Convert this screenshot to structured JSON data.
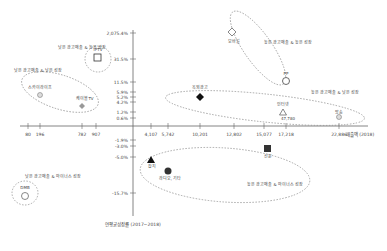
{
  "chart_data": {
    "type": "scatter",
    "title": "",
    "xlabel": "매출액 (2018)",
    "ylabel": "연평균성장률 (2017~2018)",
    "x_ticks": [
      "80",
      "196",
      "782",
      "907",
      "4,107",
      "5,742",
      "10,201",
      "12,802",
      "15,077",
      "17,218",
      "22,886"
    ],
    "y_ticks": [
      "2,075.4%",
      "31.5%",
      "11.5%",
      "5.9%",
      "5.2%",
      "4.2%",
      "1.2%",
      "0.6%",
      "-1.9%",
      "-3.0%",
      "-5.0%",
      "-15.7%"
    ],
    "points": [
      {
        "name": "IPTV",
        "shape": "square-open",
        "x": 907,
        "y": 31.5
      },
      {
        "name": "스카이라이프",
        "shape": "circle-small",
        "x": 196,
        "y": 5.2
      },
      {
        "name": "케이블TV",
        "shape": "diamond-gray",
        "x": 782,
        "y": 4.2
      },
      {
        "name": "옥외광고",
        "shape": "diamond-filled",
        "x": 10201,
        "y": 5.2
      },
      {
        "name": "모바일",
        "shape": "diamond-open",
        "x": 12802,
        "y": 2075.4
      },
      {
        "name": "PP",
        "shape": "circle-open",
        "x": 15077,
        "y": 11.5
      },
      {
        "name": "인터넷",
        "shape": "triangle-open",
        "x": 17218,
        "y": 1.2
      },
      {
        "name": "방송",
        "shape": "circle-small",
        "x": 22886,
        "y": 0.6
      },
      {
        "name": "잡지",
        "shape": "triangle-filled",
        "x": 4107,
        "y": -3.0
      },
      {
        "name": "라디오, 기타",
        "shape": "circle-filled",
        "x": 5742,
        "y": -5.0
      },
      {
        "name": "신문",
        "shape": "square-filled",
        "x": 15077,
        "y": -1.9
      },
      {
        "name": "DMB",
        "shape": "circle-open",
        "x": 80,
        "y": -15.7
      }
    ],
    "groups": [
      {
        "label": "낮은 광고매출 & 높은 성장",
        "members": [
          "IPTV"
        ]
      },
      {
        "label": "낮은 광고매출 & 낮은 성장",
        "members": [
          "스카이라이프",
          "케이블TV"
        ]
      },
      {
        "label": "높은 광고매출 & 높은 성장",
        "members": [
          "모바일",
          "PP"
        ]
      },
      {
        "label": "높은 광고매출 & 낮은 성장",
        "members": [
          "옥외광고",
          "인터넷",
          "방송"
        ]
      },
      {
        "label": "높은 광고매출 & 마이너스 성장",
        "members": [
          "잡지",
          "라디오, 기타",
          "신문"
        ]
      },
      {
        "label": "낮은 광고매출 & 마이너스 성장",
        "members": [
          "DMB"
        ]
      }
    ],
    "extra_labels": {
      "internet_value": "47,780"
    },
    "grid": false,
    "legend": "none"
  }
}
